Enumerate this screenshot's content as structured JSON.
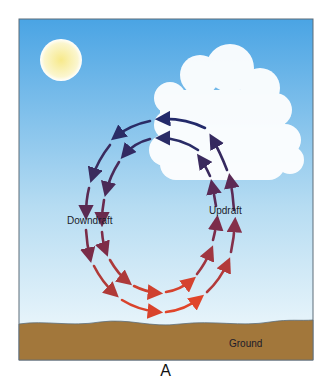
{
  "labels": {
    "downdraft": "Downdraft",
    "updraft": "Updraft",
    "ground": "Ground"
  },
  "caption": "A",
  "colors": {
    "sky_top": "#4fa8e6",
    "sky_bottom": "#f3fafd",
    "ground": "#a3783c",
    "sun": "#fbf3b8",
    "arrow_top": "#232a6a",
    "arrow_mid": "#7a2a4a",
    "arrow_bottom": "#e0452a"
  }
}
